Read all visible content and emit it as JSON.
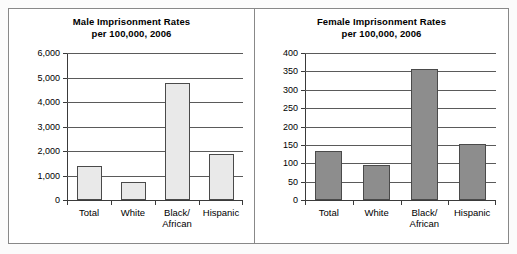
{
  "page": {
    "background": "#fbfbfb",
    "outline_color": "#888888"
  },
  "charts": [
    {
      "id": "male",
      "title_line1": "Male Imprisonment Rates",
      "title_line2": "per 100,000, 2006"
    },
    {
      "id": "female",
      "title_line1": "Female Imprisonment Rates",
      "title_line2": "per 100,000,  2006"
    }
  ],
  "chart_data": [
    {
      "type": "bar",
      "id": "male",
      "title": "Male Imprisonment Rates per 100,000, 2006",
      "xlabel": "",
      "ylabel": "",
      "categories": [
        "Total",
        "White",
        "Black/\nAfrican",
        "Hispanic"
      ],
      "values": [
        1380,
        740,
        4790,
        1860
      ],
      "ylim": [
        0,
        6000
      ],
      "ytick_values": [
        0,
        1000,
        2000,
        3000,
        4000,
        5000,
        6000
      ],
      "ytick_labels": [
        "0",
        "1,000",
        "2,000",
        "3,000",
        "4,000",
        "5,000",
        "6,000"
      ],
      "grid": true,
      "legend": "none",
      "bar_fill": "#e9e9e9",
      "bar_stroke": "#4a4a4a"
    },
    {
      "type": "bar",
      "id": "female",
      "title": "Female Imprisonment Rates per 100,000,  2006",
      "xlabel": "",
      "ylabel": "",
      "categories": [
        "Total",
        "White",
        "Black/\nAfrican",
        "Hispanic"
      ],
      "values": [
        134,
        95,
        356,
        152
      ],
      "ylim": [
        0,
        400
      ],
      "ytick_values": [
        0,
        50,
        100,
        150,
        200,
        250,
        300,
        350,
        400
      ],
      "ytick_labels": [
        "0",
        "50",
        "100",
        "150",
        "200",
        "250",
        "300",
        "350",
        "400"
      ],
      "grid": true,
      "legend": "none",
      "bar_fill": "#8d8d8d",
      "bar_stroke": "#4a4a4a"
    }
  ]
}
